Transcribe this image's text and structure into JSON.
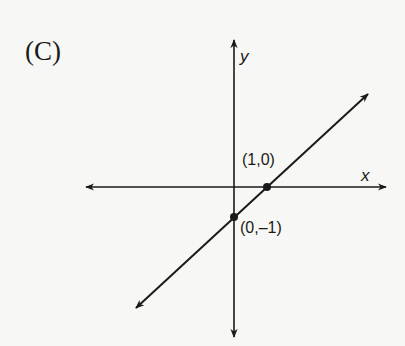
{
  "figure": {
    "choice_label": "(C)",
    "axes": {
      "x_label": "x",
      "y_label": "y"
    },
    "points": [
      {
        "label": "(1,0)",
        "x": 1,
        "y": 0
      },
      {
        "label": "(0,–1)",
        "x": 0,
        "y": -1
      }
    ],
    "line": {
      "slope": 1,
      "intercept": -1,
      "equation": "y = x - 1"
    },
    "colors": {
      "ink": "#1a1a1a",
      "background": "#f7f7f5"
    }
  }
}
